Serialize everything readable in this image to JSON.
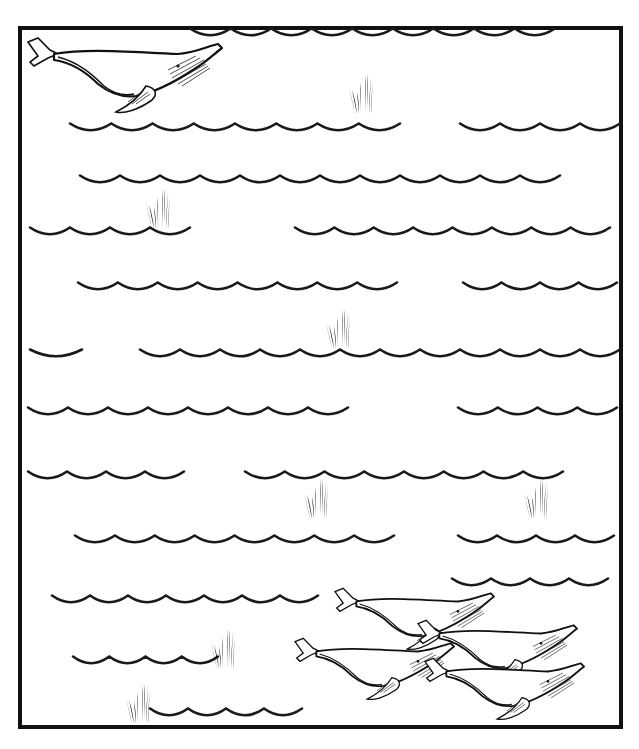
{
  "scene": {
    "kind": "ocean-illustration-maze",
    "frame": {
      "x": 20,
      "y": 28,
      "width": 601,
      "height": 699,
      "stroke": "#111111"
    },
    "colors": {
      "ink": "#1a1a1a",
      "kelp": "#777777",
      "paper": "#ffffff"
    },
    "wave_rows": [
      {
        "y": 33,
        "segments": [
          [
            190,
            555
          ]
        ]
      },
      {
        "y": 128,
        "segments": [
          [
            70,
            400
          ],
          [
            460,
            620
          ]
        ]
      },
      {
        "y": 180,
        "segments": [
          [
            80,
            560
          ]
        ]
      },
      {
        "y": 232,
        "segments": [
          [
            30,
            190
          ],
          [
            295,
            610
          ]
        ]
      },
      {
        "y": 287,
        "segments": [
          [
            78,
            397
          ],
          [
            463,
            617
          ]
        ]
      },
      {
        "y": 354,
        "segments": [
          [
            30,
            82
          ],
          [
            140,
            620
          ]
        ]
      },
      {
        "y": 412,
        "segments": [
          [
            28,
            348
          ],
          [
            458,
            617
          ]
        ]
      },
      {
        "y": 476,
        "segments": [
          [
            28,
            184
          ],
          [
            245,
            563
          ]
        ]
      },
      {
        "y": 540,
        "segments": [
          [
            75,
            394
          ],
          [
            458,
            614
          ]
        ]
      },
      {
        "y": 583,
        "segments": [
          [
            452,
            608
          ]
        ]
      },
      {
        "y": 600,
        "segments": [
          [
            52,
            318
          ]
        ]
      },
      {
        "y": 661,
        "segments": [
          [
            73,
            218
          ]
        ]
      },
      {
        "y": 713,
        "segments": [
          [
            150,
            302
          ]
        ]
      }
    ],
    "kelp": [
      {
        "x": 363,
        "y": 100
      },
      {
        "x": 160,
        "y": 215
      },
      {
        "x": 340,
        "y": 335
      },
      {
        "x": 318,
        "y": 505
      },
      {
        "x": 538,
        "y": 505
      },
      {
        "x": 225,
        "y": 655
      },
      {
        "x": 140,
        "y": 710
      }
    ],
    "whales": [
      {
        "name": "lone-whale",
        "x": 28,
        "y": 40,
        "scale": 1.0
      },
      {
        "name": "pod-whale-1",
        "x": 335,
        "y": 590,
        "scale": 0.82
      },
      {
        "name": "pod-whale-2",
        "x": 418,
        "y": 622,
        "scale": 0.82
      },
      {
        "name": "pod-whale-3",
        "x": 295,
        "y": 640,
        "scale": 0.82
      },
      {
        "name": "pod-whale-4",
        "x": 425,
        "y": 660,
        "scale": 0.82
      }
    ]
  }
}
